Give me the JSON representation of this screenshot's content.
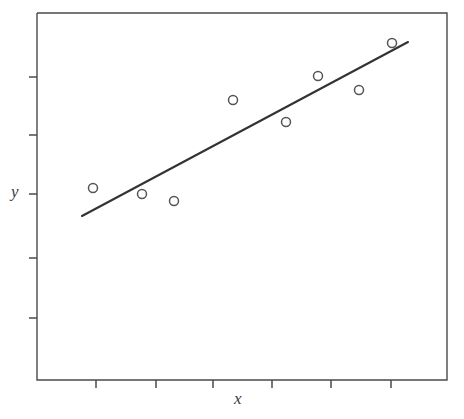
{
  "figure": {
    "background_color": "#ffffff",
    "ink_color": "#4a4a4a",
    "line_color": "#333333",
    "marker_color": "#555555",
    "width": 464,
    "height": 419
  },
  "axes": {
    "x_label": "x",
    "y_label": "y",
    "frame": {
      "left": 37,
      "top": 13,
      "right": 447,
      "bottom": 380
    },
    "x_tick_positions": [
      96,
      156,
      213,
      272,
      331,
      391
    ],
    "y_tick_positions": [
      77,
      135,
      194,
      258,
      318
    ],
    "x_tick_labels": [
      "",
      "",
      "",
      "",
      "",
      ""
    ],
    "y_tick_labels": [
      "",
      "",
      "",
      "",
      ""
    ],
    "tick_length": 8,
    "tick_direction": "out"
  },
  "chart_data": {
    "type": "scatter",
    "title": "",
    "subtitle": "",
    "xlabel": "x",
    "ylabel": "y",
    "grid": false,
    "legend": null,
    "legend_position": "none",
    "axis_ticks_labeled": false,
    "xlim": [
      0,
      10
    ],
    "ylim": [
      0,
      10
    ],
    "marker": "open-circle",
    "marker_radius_px": 4.5,
    "points_px": [
      {
        "x": 93,
        "y": 188
      },
      {
        "x": 142,
        "y": 194
      },
      {
        "x": 174,
        "y": 201
      },
      {
        "x": 233,
        "y": 100
      },
      {
        "x": 286,
        "y": 122
      },
      {
        "x": 318,
        "y": 76
      },
      {
        "x": 359,
        "y": 90
      },
      {
        "x": 392,
        "y": 43
      }
    ],
    "x": [
      1.37,
      2.56,
      3.34,
      4.78,
      6.07,
      6.85,
      7.85,
      8.66
    ],
    "y": [
      3.4,
      3.24,
      3.05,
      5.81,
      5.21,
      6.46,
      6.08,
      7.37
    ],
    "series": [
      {
        "name": "observations",
        "x": [
          1.37,
          2.56,
          3.34,
          4.78,
          6.07,
          6.85,
          7.85,
          8.66
        ],
        "values": [
          3.4,
          3.24,
          3.05,
          5.81,
          5.21,
          6.46,
          6.08,
          7.37
        ]
      }
    ],
    "fit_line": {
      "name": "least-squares regression line",
      "x_start_px": 82,
      "y_start_px": 216,
      "x_end_px": 408,
      "y_end_px": 42,
      "x_start": 1.1,
      "y_start": 2.64,
      "x_end": 9.05,
      "y_end": 7.38,
      "slope": 0.596,
      "intercept": 1.98
    },
    "annotations": []
  }
}
